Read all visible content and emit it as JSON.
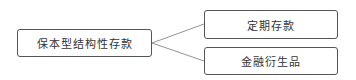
{
  "diagram": {
    "root": {
      "label": "保本型结构性存款"
    },
    "children": [
      {
        "label": "定期存款"
      },
      {
        "label": "金融衍生品"
      }
    ],
    "colors": {
      "border": "#555555",
      "line": "#777777",
      "text": "#333333"
    }
  }
}
